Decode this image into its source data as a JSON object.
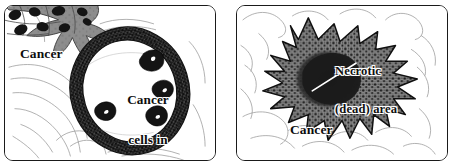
{
  "figure": {
    "background_color": "#ffffff",
    "panel_border_color": "#1a1a1a",
    "ink_color": "#0d0d0d"
  },
  "panels": [
    {
      "id": "left",
      "name": "cancer-cells-in-blood-vessel",
      "labels": {
        "tumor": "Cancer",
        "vessel_line1": "Cancer",
        "vessel_line2": "cells in",
        "vessel_line3": "blood",
        "vessel_line4": "vessel"
      },
      "features": {
        "tumor_mass_fill": "#8d8d8d",
        "tumor_nuclei_fill": "#151515",
        "vessel_wall_fill": "#2a2a2a",
        "vessel_lumen_fill": "#ffffff",
        "cancer_cell_fill": "#141414",
        "cancer_cell_count": 4,
        "tissue_line_color": "#9a9a9a"
      }
    },
    {
      "id": "right",
      "name": "necrotic-tumor-mass",
      "labels": {
        "necrotic_line1": "Necrotic",
        "necrotic_line2": "(dead) area",
        "tumor": "Cancer"
      },
      "features": {
        "tumor_mass_fill": "#858585",
        "stipple_color": "#1b1b1b",
        "necrotic_core_fill": "#1d1d1d",
        "leader_line_color": "#ffffff",
        "tissue_line_color": "#9a9a9a",
        "spike_count": 11
      }
    }
  ]
}
